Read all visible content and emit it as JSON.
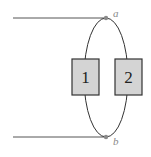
{
  "diagram": {
    "type": "circuit",
    "nodes": [
      {
        "id": "a",
        "label": "a"
      },
      {
        "id": "b",
        "label": "b"
      }
    ],
    "elements": [
      {
        "id": "1",
        "label": "1"
      },
      {
        "id": "2",
        "label": "2"
      }
    ],
    "connections": "Elements 1 and 2 connected in parallel between nodes a and b",
    "colors": {
      "wire": "#333333",
      "lead": "#555555",
      "node": "#8a8a8a",
      "box_fill": "#d4d4d4",
      "box_stroke": "#333333"
    }
  }
}
